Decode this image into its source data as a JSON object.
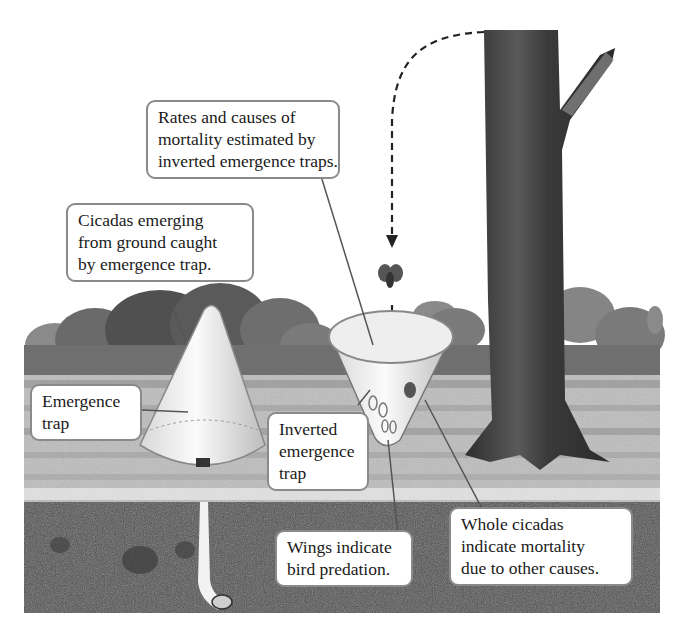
{
  "diagram": {
    "type": "illustration",
    "callouts": {
      "mortality_rates": {
        "lines": [
          "Rates and causes of",
          "mortality estimated by",
          "inverted emergence traps."
        ]
      },
      "cicadas_emerging": {
        "lines": [
          "Cicadas emerging",
          "from ground caught",
          "by emergence trap."
        ]
      },
      "emergence_trap": {
        "lines": [
          "Emergence",
          "trap"
        ]
      },
      "inverted_trap": {
        "lines": [
          "Inverted",
          "emergence",
          "trap"
        ]
      },
      "wings": {
        "lines": [
          "Wings indicate",
          "bird predation."
        ]
      },
      "whole_cicadas": {
        "lines": [
          "Whole cicadas",
          "indicate mortality",
          "due to other causes."
        ]
      }
    },
    "elements": [
      "tree-trunk",
      "dashed-flight-path-arrow",
      "falling-cicada",
      "inverted-cone-trap",
      "upright-cone-trap",
      "underground-burrow",
      "nymph-in-burrow",
      "shrubs",
      "ground-surface",
      "soil-layer"
    ],
    "colors": {
      "soil": "#4d4d4d",
      "ground": "#c8c8c8",
      "shrubs": "#6e6e6e",
      "trunk": "#3a3a3a",
      "callout_border": "#8a8a8a",
      "text": "#1a1a1a"
    }
  }
}
